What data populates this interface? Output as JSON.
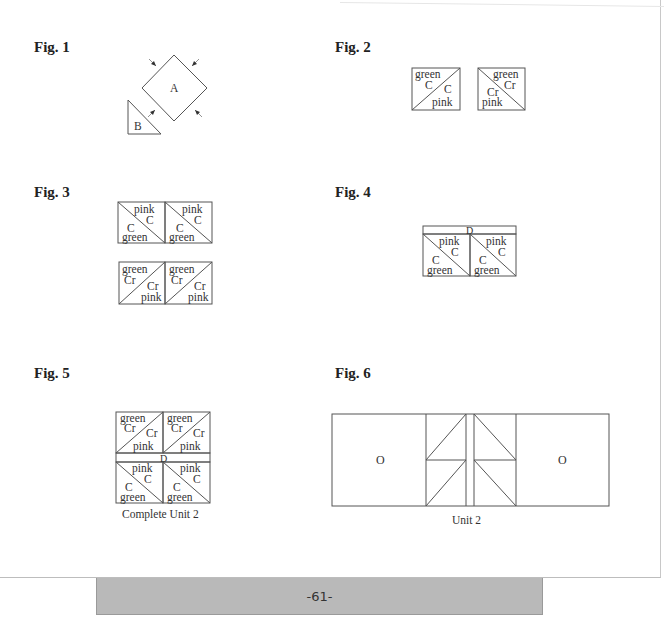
{
  "figures": [
    {
      "label": "Fig. 1",
      "pieces": [
        "A",
        "B"
      ]
    },
    {
      "label": "Fig. 2",
      "units": [
        {
          "upper": [
            "green",
            "C"
          ],
          "lower": [
            "C",
            "pink"
          ]
        },
        {
          "upper": [
            "green",
            "Cr"
          ],
          "lower": [
            "Cr",
            "pink"
          ]
        }
      ]
    },
    {
      "label": "Fig. 3",
      "rows": [
        {
          "upper": [
            "pink",
            "C"
          ],
          "lower": [
            "C",
            "green"
          ]
        },
        {
          "upper": [
            "green",
            "Cr"
          ],
          "lower": [
            "Cr",
            "pink"
          ]
        }
      ]
    },
    {
      "label": "Fig. 4",
      "strip": "D",
      "upper": [
        "pink",
        "C"
      ],
      "lower": [
        "C",
        "green"
      ]
    },
    {
      "label": "Fig. 5",
      "strip": "D",
      "caption": "Complete Unit 2",
      "top": {
        "upper": [
          "green",
          "Cr"
        ],
        "lower": [
          "Cr",
          "pink"
        ]
      },
      "bottom": {
        "upper": [
          "pink",
          "C"
        ],
        "lower": [
          "C",
          "green"
        ]
      }
    },
    {
      "label": "Fig. 6",
      "left_block": "O",
      "right_block": "O",
      "caption": "Unit 2"
    }
  ],
  "footer": {
    "page_number": "-61-"
  },
  "colors": {
    "line": "#555555",
    "text": "#333333",
    "footer_bg": "#b9b9b9"
  }
}
